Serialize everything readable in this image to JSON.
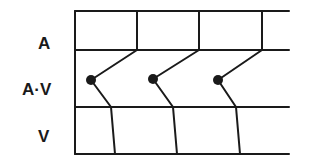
{
  "labels": {
    "atrium": "A",
    "av_junction": "A·V",
    "ventricle": "V"
  },
  "colors": {
    "line": "#1a1a1a",
    "background": "#ffffff"
  },
  "diagram": {
    "type": "ladder-diagram",
    "rows": [
      "A",
      "A·V",
      "V"
    ],
    "beats": 3,
    "grid": {
      "left_x": 75,
      "right_x": 289,
      "row_lines_y": [
        11,
        50,
        107,
        154
      ]
    },
    "beat_paths": [
      {
        "atrial_x": 137,
        "origin_dot": [
          91,
          80
        ],
        "av_exit": [
          111,
          107
        ],
        "ventricle_end": [
          115,
          154
        ]
      },
      {
        "atrial_x": 199,
        "origin_dot": [
          153,
          79
        ],
        "av_exit": [
          173,
          107
        ],
        "ventricle_end": [
          177,
          154
        ]
      },
      {
        "atrial_x": 262,
        "origin_dot": [
          218,
          80
        ],
        "av_exit": [
          236,
          107
        ],
        "ventricle_end": [
          240,
          154
        ]
      }
    ]
  }
}
